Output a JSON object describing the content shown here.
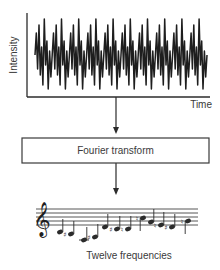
{
  "plot": {
    "y_label": "Intensity",
    "x_label": "Time",
    "frame": {
      "x0": 27,
      "y0": 13,
      "x1": 210,
      "y1": 97
    },
    "waveform": {
      "x_start": 35,
      "x_end": 207,
      "period_px": 17.2,
      "center_y": 55,
      "pattern": [
        0,
        -22,
        14,
        -30,
        20,
        -8,
        30,
        -36,
        10,
        -14,
        34,
        -4,
        22
      ]
    }
  },
  "arrows": [
    {
      "x": 116,
      "y1": 97,
      "y2": 134
    },
    {
      "x": 116,
      "y1": 163,
      "y2": 195
    }
  ],
  "transform_box": {
    "label": "Fourier transform",
    "x": 22,
    "y": 138,
    "width": 187,
    "height": 25
  },
  "staff": {
    "x0": 36,
    "x1": 198,
    "lines_y": [
      209,
      213,
      217,
      221,
      225
    ],
    "clef": "treble",
    "notes": [
      {
        "x": 60,
        "y": 232,
        "accidental": "",
        "stem": "up"
      },
      {
        "x": 71,
        "y": 234,
        "accidental": "sharp",
        "stem": "up"
      },
      {
        "x": 84,
        "y": 240,
        "accidental": "",
        "stem": "up",
        "ledger": true
      },
      {
        "x": 95,
        "y": 237,
        "accidental": "sharp",
        "stem": "up"
      },
      {
        "x": 105,
        "y": 227,
        "accidental": "",
        "stem": "up"
      },
      {
        "x": 117,
        "y": 229,
        "accidental": "sharp",
        "stem": "up"
      },
      {
        "x": 128,
        "y": 229,
        "accidental": "natural",
        "stem": "up"
      },
      {
        "x": 143,
        "y": 218,
        "accidental": "natural",
        "stem": "down"
      },
      {
        "x": 151,
        "y": 222,
        "accidental": "",
        "stem": "up"
      },
      {
        "x": 161,
        "y": 225,
        "accidental": "natural",
        "stem": "up"
      },
      {
        "x": 172,
        "y": 227,
        "accidental": "sharp",
        "stem": "up"
      },
      {
        "x": 188,
        "y": 221,
        "accidental": "natural",
        "stem": "down"
      }
    ]
  },
  "caption": "Twelve frequencies",
  "colors": {
    "ink": "#2b2b2b",
    "text": "#3a3a3a",
    "background": "#ffffff"
  }
}
